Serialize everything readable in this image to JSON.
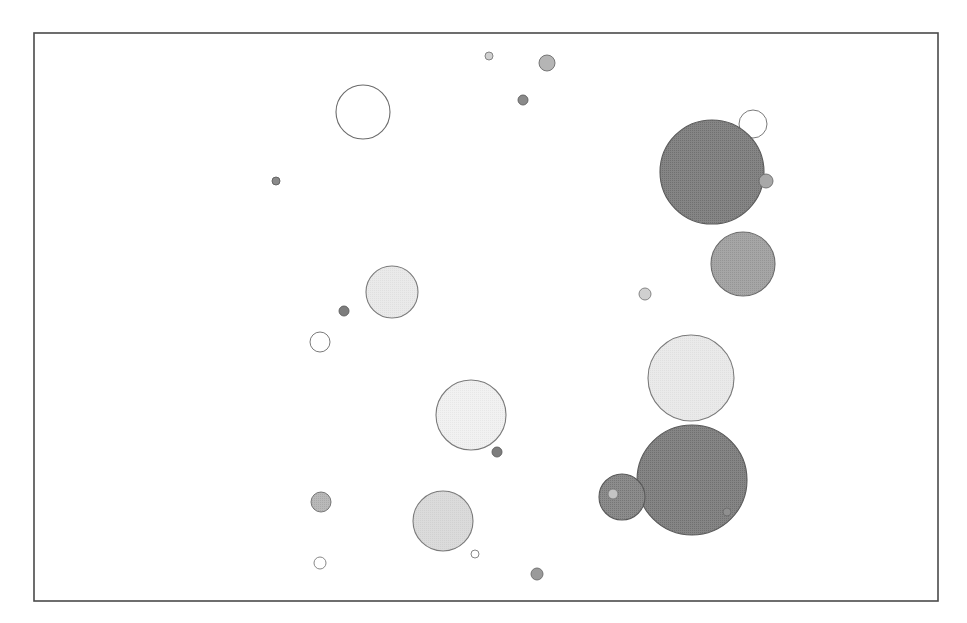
{
  "figure": {
    "title": "",
    "background_color": "#ffffff",
    "width": 967,
    "height": 623
  },
  "plot_frame": {
    "name": "plot-border",
    "x": 34,
    "y": 33,
    "width": 904,
    "height": 568,
    "stroke_color": "#4a4a4a",
    "stroke_width": 1.6,
    "fill": "#ffffff"
  },
  "palette": {
    "dark_gray": "#6e6e6e",
    "medium_gray": "#9a9a9a",
    "light_gray": "#d0d0d0",
    "very_light_gray": "#e8e8e8",
    "near_white": "#f4f4f4",
    "white": "#ffffff",
    "outline": "#6b6b6b"
  },
  "axes": {
    "x_ticks": [],
    "y_ticks": [],
    "xlabel": "",
    "ylabel": "",
    "grid": false,
    "tick_labels_visible": false
  },
  "legend": {
    "visible": false,
    "entries": []
  },
  "chart_data": {
    "type": "scatter",
    "title": "",
    "xlabel": "",
    "ylabel": "",
    "grid": false,
    "legend_position": "none",
    "xlim": [
      34,
      938
    ],
    "ylim": [
      601,
      33
    ],
    "note": "Bubble/scatter plot; x and y are pixel positions within the plot frame, r is bubble radius in pixels, shade is the halftone grey fill value.",
    "points": [
      {
        "id": "p01",
        "x": 489,
        "y": 56,
        "r": 4,
        "fill": "#d0d0d0",
        "stroke": "#7a7a7a",
        "shade": "light"
      },
      {
        "id": "p02",
        "x": 547,
        "y": 63,
        "r": 8,
        "fill": "#b5b5b5",
        "stroke": "#6b6b6b",
        "shade": "medium"
      },
      {
        "id": "p03",
        "x": 523,
        "y": 100,
        "r": 5,
        "fill": "#8a8a8a",
        "stroke": "#5d5d5d",
        "shade": "dark"
      },
      {
        "id": "p04",
        "x": 363,
        "y": 112,
        "r": 27,
        "fill": "#ffffff",
        "stroke": "#6b6b6b",
        "shade": "open"
      },
      {
        "id": "p05",
        "x": 753,
        "y": 124,
        "r": 14,
        "fill": "#ffffff",
        "stroke": "#6b6b6b",
        "shade": "open"
      },
      {
        "id": "p06",
        "x": 712,
        "y": 172,
        "r": 52,
        "fill": "#6e6e6e",
        "stroke": "#5a5a5a",
        "shade": "dark"
      },
      {
        "id": "p07",
        "x": 276,
        "y": 181,
        "r": 4,
        "fill": "#8a8a8a",
        "stroke": "#5d5d5d",
        "shade": "dark"
      },
      {
        "id": "p08",
        "x": 766,
        "y": 181,
        "r": 7,
        "fill": "#a8a8a8",
        "stroke": "#6b6b6b",
        "shade": "medium"
      },
      {
        "id": "p09",
        "x": 743,
        "y": 264,
        "r": 32,
        "fill": "#9a9a9a",
        "stroke": "#6b6b6b",
        "shade": "medium"
      },
      {
        "id": "p10",
        "x": 392,
        "y": 292,
        "r": 26,
        "fill": "#e8e8e8",
        "stroke": "#7a7a7a",
        "shade": "very-light"
      },
      {
        "id": "p11",
        "x": 645,
        "y": 294,
        "r": 6,
        "fill": "#d0d0d0",
        "stroke": "#7a7a7a",
        "shade": "light"
      },
      {
        "id": "p12",
        "x": 344,
        "y": 311,
        "r": 5,
        "fill": "#7d7d7d",
        "stroke": "#5d5d5d",
        "shade": "dark"
      },
      {
        "id": "p13",
        "x": 320,
        "y": 342,
        "r": 10,
        "fill": "#ffffff",
        "stroke": "#6b6b6b",
        "shade": "open"
      },
      {
        "id": "p14",
        "x": 691,
        "y": 378,
        "r": 43,
        "fill": "#e8e8e8",
        "stroke": "#7a7a7a",
        "shade": "very-light"
      },
      {
        "id": "p15",
        "x": 471,
        "y": 415,
        "r": 35,
        "fill": "#f0f0f0",
        "stroke": "#7a7a7a",
        "shade": "near-white"
      },
      {
        "id": "p16",
        "x": 497,
        "y": 452,
        "r": 5,
        "fill": "#7d7d7d",
        "stroke": "#5d5d5d",
        "shade": "dark"
      },
      {
        "id": "p17",
        "x": 692,
        "y": 480,
        "r": 55,
        "fill": "#6e6e6e",
        "stroke": "#5a5a5a",
        "shade": "dark"
      },
      {
        "id": "p18",
        "x": 622,
        "y": 497,
        "r": 23,
        "fill": "#767676",
        "stroke": "#5a5a5a",
        "shade": "dark"
      },
      {
        "id": "p19",
        "x": 613,
        "y": 494,
        "r": 5,
        "fill": "#c4c4c4",
        "stroke": "#7a7a7a",
        "shade": "light"
      },
      {
        "id": "p20",
        "x": 321,
        "y": 502,
        "r": 10,
        "fill": "#b0b0b0",
        "stroke": "#6b6b6b",
        "shade": "medium"
      },
      {
        "id": "p21",
        "x": 443,
        "y": 521,
        "r": 30,
        "fill": "#d8d8d8",
        "stroke": "#7a7a7a",
        "shade": "light"
      },
      {
        "id": "p22",
        "x": 475,
        "y": 554,
        "r": 4,
        "fill": "#ffffff",
        "stroke": "#7a7a7a",
        "shade": "open"
      },
      {
        "id": "p23",
        "x": 320,
        "y": 563,
        "r": 6,
        "fill": "#ffffff",
        "stroke": "#7a7a7a",
        "shade": "open"
      },
      {
        "id": "p24",
        "x": 537,
        "y": 574,
        "r": 6,
        "fill": "#9a9a9a",
        "stroke": "#6b6b6b",
        "shade": "medium"
      },
      {
        "id": "p25",
        "x": 727,
        "y": 512,
        "r": 4,
        "fill": "#8f8f8f",
        "stroke": "#6b6b6b",
        "shade": "medium"
      }
    ]
  }
}
